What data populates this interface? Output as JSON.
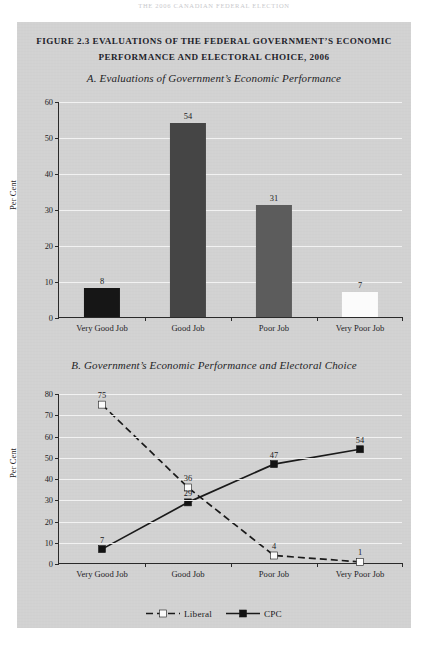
{
  "page": {
    "running_header": "THE 2006 CANADIAN FEDERAL ELECTION",
    "background_color": "#ffffff",
    "panel_color": "#d2d2d2"
  },
  "figure": {
    "title_line1": "FIGURE 2.3 EVALUATIONS OF THE FEDERAL GOVERNMENT’S ECONOMIC",
    "title_line2": "PERFORMANCE AND ELECTORAL CHOICE, 2006"
  },
  "chart_data": [
    {
      "id": "panel-a",
      "type": "bar",
      "title": "A. Evaluations of Government’s Economic Performance",
      "xlabel": "",
      "ylabel": "Per Cent",
      "ylim": [
        0,
        60
      ],
      "yticks": [
        0,
        10,
        20,
        30,
        40,
        50,
        60
      ],
      "grid": true,
      "legend": "none",
      "categories": [
        "Very Good Job",
        "Good Job",
        "Poor Job",
        "Very Poor Job"
      ],
      "values": [
        8,
        54,
        31,
        7
      ],
      "bar_colors": [
        "#161616",
        "#454545",
        "#5c5c5c",
        "#fbfbfb"
      ]
    },
    {
      "id": "panel-b",
      "type": "line",
      "title": "B. Government’s Economic Performance and Electoral Choice",
      "xlabel": "",
      "ylabel": "Per Cent",
      "ylim": [
        0,
        80
      ],
      "yticks": [
        0,
        10,
        20,
        30,
        40,
        50,
        60,
        70,
        80
      ],
      "grid": true,
      "legend": "bottom-center",
      "categories": [
        "Very Good Job",
        "Good Job",
        "Poor Job",
        "Very Poor Job"
      ],
      "series": [
        {
          "name": "Liberal",
          "values": [
            75,
            36,
            4,
            1
          ],
          "line_style": "dashed",
          "marker": "square",
          "marker_fill": "#fbfbfb",
          "line_color": "#1a1a1a"
        },
        {
          "name": "CPC",
          "values": [
            7,
            29,
            47,
            54
          ],
          "line_style": "solid",
          "marker": "square",
          "marker_fill": "#131313",
          "line_color": "#1a1a1a"
        }
      ]
    }
  ],
  "legend": {
    "items": [
      {
        "label": "Liberal",
        "style": "dashed",
        "marker_fill": "#fbfbfb"
      },
      {
        "label": "CPC",
        "style": "solid",
        "marker_fill": "#131313"
      }
    ]
  }
}
